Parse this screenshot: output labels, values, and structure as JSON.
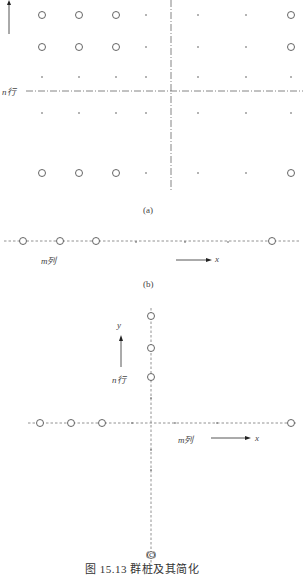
{
  "figure": {
    "caption": "图 15.13  群桩及其简化",
    "panels": [
      {
        "id": "a",
        "label": "(a)"
      },
      {
        "id": "b",
        "label": "(b)"
      },
      {
        "id": "c",
        "label": "(c)"
      }
    ]
  },
  "panel_a": {
    "row_label": "n行",
    "grid": {
      "columns_x": [
        42,
        79,
        116,
        146,
        198,
        246,
        291
      ],
      "rows_y": [
        15,
        47,
        77,
        113,
        173
      ],
      "circles": [
        [
          1,
          1,
          1,
          0,
          0,
          0,
          1
        ],
        [
          1,
          1,
          1,
          0,
          0,
          0,
          1
        ],
        [
          0,
          0,
          0,
          0,
          0,
          0,
          0
        ],
        [
          0,
          0,
          0,
          0,
          0,
          0,
          0
        ],
        [
          1,
          1,
          1,
          0,
          0,
          0,
          1
        ]
      ]
    },
    "center_line_x": 171,
    "center_line_y": 91
  },
  "panel_b": {
    "axis_label": "x",
    "column_label": "m列",
    "line_y": 241,
    "pile_x": [
      23,
      60,
      96,
      272
    ],
    "dots_x": [
      136,
      185,
      228
    ]
  },
  "panel_c": {
    "x_axis_label": "x",
    "y_axis_label": "y",
    "row_label": "n行",
    "column_label": "m列",
    "axis_x": 151,
    "axis_y": 423,
    "pile_x": [
      40,
      71,
      102,
      291
    ],
    "pile_y": [
      316,
      348,
      377,
      555
    ],
    "dots_x": [
      132,
      175,
      217
    ],
    "dots_y": [
      398,
      450,
      470
    ]
  }
}
